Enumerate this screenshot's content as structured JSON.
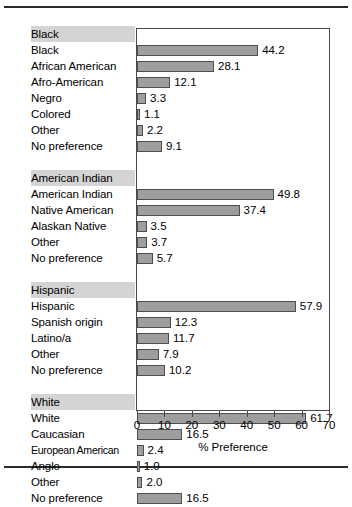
{
  "figure": {
    "rules": {
      "top": true,
      "bottom": true
    }
  },
  "chart_data": {
    "type": "bar",
    "orientation": "horizontal",
    "title": "",
    "xlabel": "% Preference",
    "ylabel": "",
    "xlim": [
      0,
      70
    ],
    "xticks": [
      0,
      10,
      20,
      30,
      40,
      50,
      60,
      70
    ],
    "xticklabels": [
      "0",
      "10",
      "20",
      "30",
      "40",
      "50",
      "60",
      "70"
    ],
    "grid": false,
    "legend": null,
    "bar_color": "#9d9d9d",
    "bar_edge_color": "#4e4e4e",
    "group_header_bg": "#d4d4d4",
    "groups": [
      {
        "name": "Black",
        "categories": [
          "Black",
          "African American",
          "Afro-American",
          "Negro",
          "Colored",
          "Other",
          "No preference"
        ],
        "values": [
          44.2,
          28.1,
          12.1,
          3.3,
          1.1,
          2.2,
          9.1
        ]
      },
      {
        "name": "American Indian",
        "categories": [
          "American Indian",
          "Native American",
          "Alaskan Native",
          "Other",
          "No preference"
        ],
        "values": [
          49.8,
          37.4,
          3.5,
          3.7,
          5.7
        ]
      },
      {
        "name": "Hispanic",
        "categories": [
          "Hispanic",
          "Spanish origin",
          "Latino/a",
          "Other",
          "No preference"
        ],
        "values": [
          57.9,
          12.3,
          11.7,
          7.9,
          10.2
        ]
      },
      {
        "name": "White",
        "categories": [
          "White",
          "Caucasian",
          "European American",
          "Anglo",
          "Other",
          "No preference"
        ],
        "values": [
          61.7,
          16.5,
          2.4,
          1.0,
          2.0,
          16.5
        ]
      }
    ]
  }
}
